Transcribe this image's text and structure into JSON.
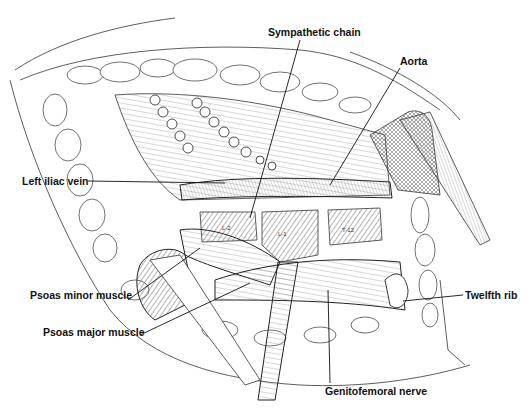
{
  "figure": {
    "type": "anatomical-illustration",
    "labels": [
      {
        "id": "sympathetic-chain",
        "text": "Sympathetic chain",
        "x": 268,
        "y": 26,
        "anchor": "left",
        "line": [
          [
            300,
            40
          ],
          [
            250,
            218
          ]
        ]
      },
      {
        "id": "aorta",
        "text": "Aorta",
        "x": 400,
        "y": 55,
        "anchor": "left",
        "line": [
          [
            400,
            68
          ],
          [
            330,
            185
          ]
        ]
      },
      {
        "id": "left-iliac-vein",
        "text": "Left iliac vein",
        "x": 22,
        "y": 175,
        "anchor": "left",
        "line": [
          [
            88,
            181
          ],
          [
            225,
            183
          ]
        ]
      },
      {
        "id": "psoas-minor-muscle",
        "text": "Psoas minor muscle",
        "x": 30,
        "y": 295,
        "anchor": "left",
        "line": [
          [
            128,
            300
          ],
          [
            200,
            248
          ]
        ]
      },
      {
        "id": "psoas-major-muscle",
        "text": "Psoas major muscle",
        "x": 43,
        "y": 331,
        "anchor": "left",
        "line": [
          [
            140,
            335
          ],
          [
            250,
            283
          ]
        ]
      },
      {
        "id": "twelfth-rib",
        "text": "Twelfth rib",
        "x": 465,
        "y": 290,
        "anchor": "left",
        "line": [
          [
            463,
            295
          ],
          [
            403,
            301
          ]
        ]
      },
      {
        "id": "genitofemoral-nerve",
        "text": "Genitofemoral nerve",
        "x": 325,
        "y": 390,
        "anchor": "left",
        "line": [
          [
            330,
            383
          ],
          [
            328,
            290
          ]
        ]
      }
    ],
    "vertebra_labels": [
      "L-2",
      "L-1",
      "T-12"
    ],
    "signature": "artist initials (illegible)"
  }
}
